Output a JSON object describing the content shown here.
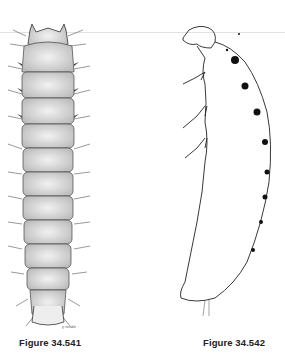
{
  "figures": [
    {
      "id": "fig-541",
      "caption": "Figure 34.541",
      "view": "dorsal",
      "signature": "g. venable"
    },
    {
      "id": "fig-542",
      "caption": "Figure 34.542",
      "view": "lateral"
    }
  ],
  "colors": {
    "ink": "#222222",
    "stipple": "#c8c8c8",
    "paper": "#ffffff"
  }
}
